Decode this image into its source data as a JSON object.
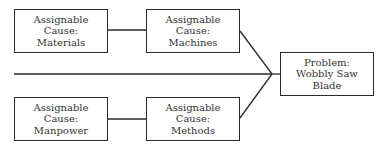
{
  "diagram": {
    "type": "fishbone",
    "problem": {
      "lines": [
        "Problem:",
        "Wobbly Saw",
        "Blade"
      ]
    },
    "causes": [
      {
        "id": "materials",
        "lines": [
          "Assignable",
          "Cause:",
          "Materials"
        ]
      },
      {
        "id": "machines",
        "lines": [
          "Assignable",
          "Cause:",
          "Machines"
        ]
      },
      {
        "id": "manpower",
        "lines": [
          "Assignable",
          "Cause:",
          "Manpower"
        ]
      },
      {
        "id": "methods",
        "lines": [
          "Assignable",
          "Cause:",
          "Methods"
        ]
      }
    ],
    "colors": {
      "line": "#2a2a2a",
      "text": "#333333",
      "background": "#ffffff"
    }
  }
}
